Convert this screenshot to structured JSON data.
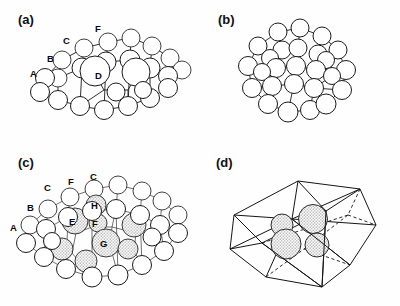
{
  "figure": {
    "type": "four-panel-structure-diagram",
    "background_color": "#fefefe",
    "line_color": "#1a1a1a",
    "atom_fill": "#ffffff",
    "shaded_atom_fill": "#d6d6d6"
  },
  "panels": [
    {
      "id": "a",
      "label": "(a)",
      "label_x": 18,
      "label_y": 12,
      "has_shaded_atoms": false,
      "site_labels": [
        {
          "text": "A",
          "x": 30,
          "y": 69
        },
        {
          "text": "B",
          "x": 47,
          "y": 54
        },
        {
          "text": "C",
          "x": 63,
          "y": 36
        },
        {
          "text": "D",
          "x": 95,
          "y": 71
        },
        {
          "text": "F",
          "x": 95,
          "y": 24
        }
      ]
    },
    {
      "id": "b",
      "label": "(b)",
      "label_x": 218,
      "label_y": 12,
      "has_shaded_atoms": false,
      "site_labels": []
    },
    {
      "id": "c",
      "label": "(c)",
      "label_x": 18,
      "label_y": 155,
      "has_shaded_atoms": true,
      "site_labels": [
        {
          "text": "A",
          "x": 10,
          "y": 223
        },
        {
          "text": "B",
          "x": 27,
          "y": 203
        },
        {
          "text": "C",
          "x": 44,
          "y": 183
        },
        {
          "text": "F",
          "x": 68,
          "y": 177
        },
        {
          "text": "C",
          "x": 90,
          "y": 172
        },
        {
          "text": "H",
          "x": 91,
          "y": 203
        },
        {
          "text": "E",
          "x": 69,
          "y": 219
        },
        {
          "text": "F",
          "x": 92,
          "y": 222
        },
        {
          "text": "G",
          "x": 100,
          "y": 243
        }
      ]
    },
    {
      "id": "d",
      "label": "(d)",
      "label_x": 216,
      "label_y": 155,
      "has_shaded_atoms": true,
      "enclosed_atom_count": 4,
      "site_labels": []
    }
  ]
}
